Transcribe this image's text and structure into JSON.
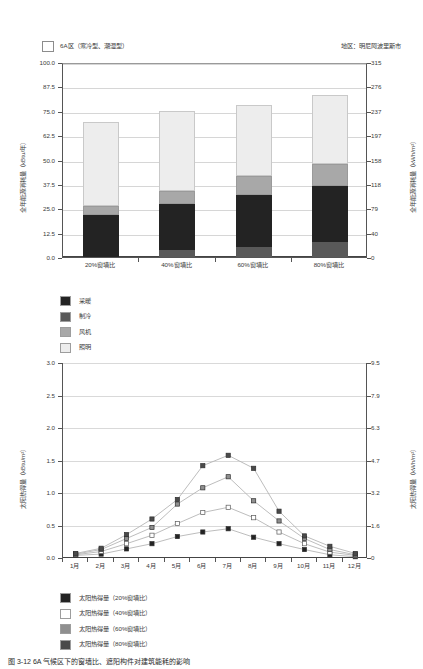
{
  "header": {
    "climate_zone_label": "6A区（寒冷型、潮湿型）",
    "region_label": "地区：明尼阿波里斯市"
  },
  "caption": "图 3-12  6A 气候区下的窗墙比、遮阳构件对建筑能耗的影响",
  "chart_data": [
    {
      "type": "bar",
      "title": "6A区（寒冷型、潮湿型）",
      "subtitle": "地区：明尼阿波里斯市",
      "stacked": true,
      "xlabel": "",
      "ylabel": "全年能源消耗量（kBtu/年）",
      "ylabel_right": "全年能源消耗量（kWh/m²）",
      "categories": [
        "20%窗墙比",
        "40%窗墙比",
        "60%窗墙比",
        "80%窗墙比"
      ],
      "ylim": [
        0.0,
        100.0
      ],
      "yticks": [
        "0.0",
        "12.5",
        "25.0",
        "37.5",
        "50.0",
        "62.5",
        "75.0",
        "87.5",
        "100.0"
      ],
      "ylim_right": [
        0,
        315
      ],
      "yticks_right": [
        "0",
        "40",
        "79",
        "118",
        "158",
        "197",
        "237",
        "276",
        "315"
      ],
      "grid": true,
      "legend_position": "below-left",
      "series": [
        {
          "name": "采暖",
          "color": "#232323",
          "values": [
            21.5,
            23.5,
            27.0,
            29.0
          ]
        },
        {
          "name": "制冷",
          "color": "#595959",
          "values": [
            0.0,
            3.5,
            5.0,
            7.5
          ]
        },
        {
          "name": "风机",
          "color": "#a8a8a8",
          "values": [
            4.5,
            7.0,
            9.5,
            11.0
          ]
        },
        {
          "name": "照明",
          "color": "#ededed",
          "values": [
            43.0,
            41.0,
            36.5,
            35.5
          ]
        }
      ],
      "totals": [
        69.0,
        75.0,
        78.0,
        83.0
      ]
    },
    {
      "type": "line",
      "xlabel": "",
      "ylabel": "太阳热得量（kBtu/m²）",
      "ylabel_right": "太阳热得量（kWh/m²）",
      "x": [
        "1月",
        "2月",
        "3月",
        "4月",
        "5月",
        "6月",
        "7月",
        "8月",
        "9月",
        "10月",
        "11月",
        "12月"
      ],
      "ylim": [
        0.0,
        3.0
      ],
      "yticks": [
        "0.0",
        "0.5",
        "1.0",
        "1.5",
        "2.0",
        "2.5",
        "3.0"
      ],
      "ylim_right": [
        0,
        9.5
      ],
      "yticks_right": [
        "0",
        "1.6",
        "3.2",
        "4.7",
        "6.3",
        "7.9",
        "9.5"
      ],
      "grid": true,
      "legend_position": "below-left",
      "series": [
        {
          "name": "太阳热得量（20%窗墙比）",
          "color": "#232323",
          "values": [
            0.04,
            0.06,
            0.14,
            0.22,
            0.33,
            0.4,
            0.45,
            0.32,
            0.22,
            0.13,
            0.05,
            0.02
          ]
        },
        {
          "name": "太阳热得量（40%窗墙比）",
          "color": "#ffffff",
          "values": [
            0.05,
            0.1,
            0.22,
            0.35,
            0.53,
            0.7,
            0.78,
            0.62,
            0.4,
            0.22,
            0.09,
            0.04
          ]
        },
        {
          "name": "太阳热得量（60%窗墙比）",
          "color": "#8f8f8f",
          "values": [
            0.06,
            0.13,
            0.3,
            0.47,
            0.83,
            1.08,
            1.25,
            0.88,
            0.57,
            0.3,
            0.13,
            0.05
          ]
        },
        {
          "name": "太阳热得量（80%窗墙比）",
          "color": "#4a4a4a",
          "values": [
            0.07,
            0.15,
            0.36,
            0.6,
            0.9,
            1.42,
            1.58,
            1.38,
            0.72,
            0.34,
            0.18,
            0.07
          ]
        }
      ]
    }
  ]
}
